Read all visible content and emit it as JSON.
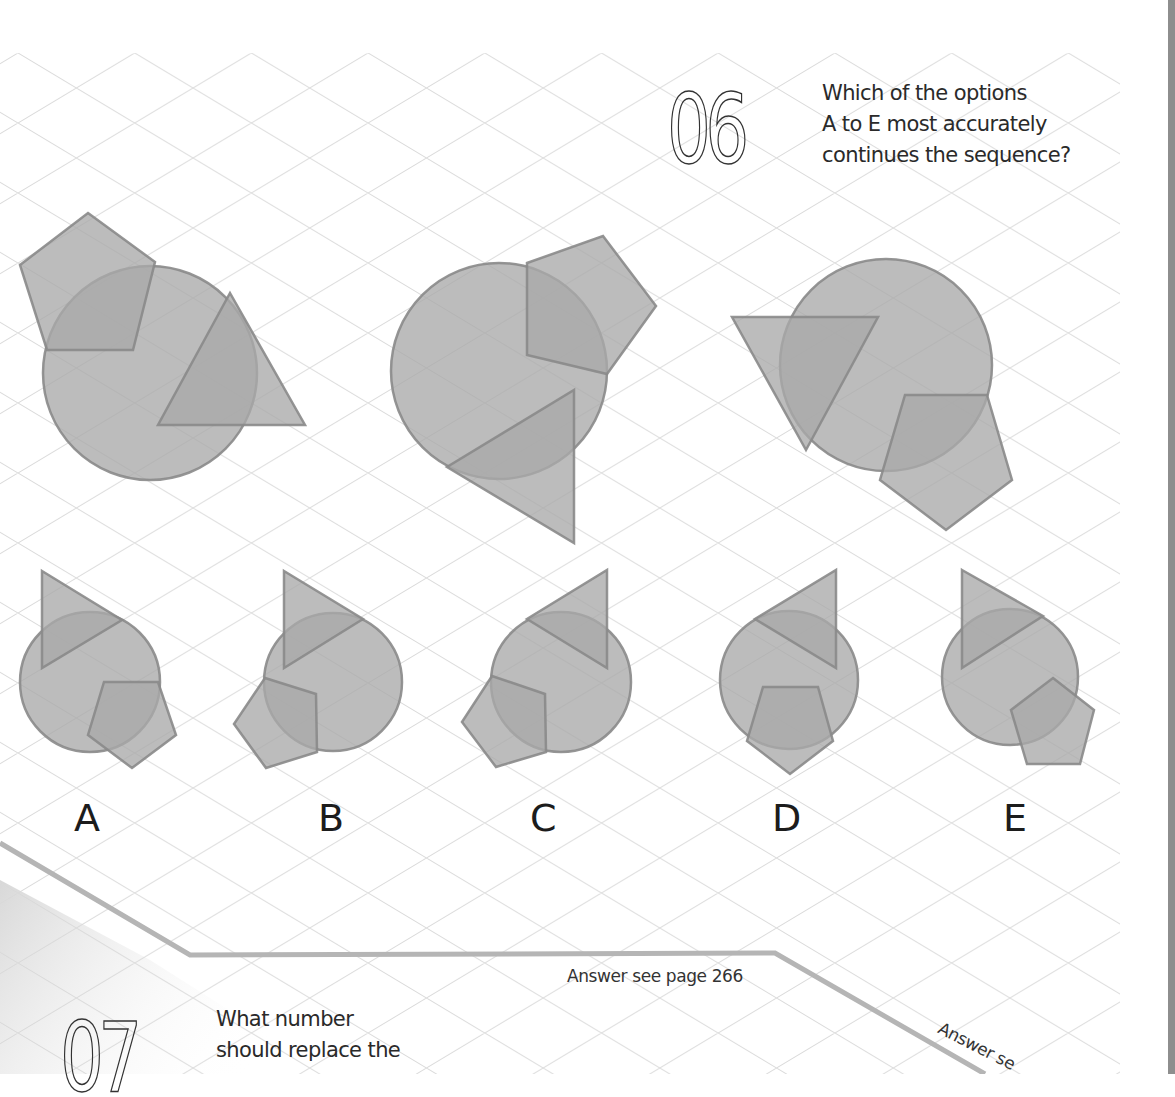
{
  "question_06": {
    "number": "06",
    "text_lines": [
      "Which of the options",
      "A to E most accurately",
      "continues the sequence?"
    ]
  },
  "sequence": [
    {
      "id": "figure-1",
      "circle": {
        "cx": 150,
        "cy": 373,
        "r": 107
      },
      "pentagon": "88,213 155,262 133,350 47,350 20,265",
      "triangle": "230,293 305,425 158,425"
    },
    {
      "id": "figure-2",
      "circle": {
        "cx": 499,
        "cy": 371,
        "r": 108
      },
      "pentagon": "527,263 603,236 656,306 607,374 527,355",
      "triangle": "574,390 574,543 447,467"
    },
    {
      "id": "figure-3",
      "circle": {
        "cx": 886,
        "cy": 365,
        "r": 106
      },
      "pentagon": "905,395 987,395 1012,480 946,530 880,480",
      "triangle": "732,317 878,317 806,450"
    }
  ],
  "options": [
    {
      "label": "A",
      "label_pos": {
        "x": 74,
        "y": 798
      },
      "circle": {
        "cx": 90,
        "cy": 682,
        "r": 70
      },
      "pentagon": "104,682 158,682 176,735 132,768 88,735",
      "triangle": "42,571 122,620 42,668"
    },
    {
      "label": "B",
      "label_pos": {
        "x": 318,
        "y": 798
      },
      "circle": {
        "cx": 333,
        "cy": 682,
        "r": 69
      },
      "pentagon": "265,678 316,694 317,752 266,768 234,724",
      "triangle": "284,571 363,619 284,668"
    },
    {
      "label": "C",
      "label_pos": {
        "x": 530,
        "y": 798
      },
      "circle": {
        "cx": 561,
        "cy": 682,
        "r": 70
      },
      "pentagon": "492,676 545,694 546,752 496,767 462,722",
      "triangle": "607,570 607,668 527,619"
    },
    {
      "label": "D",
      "label_pos": {
        "x": 772,
        "y": 798
      },
      "circle": {
        "cx": 789,
        "cy": 680,
        "r": 69
      },
      "pentagon": "763,687 818,687 833,741 790,774 747,741",
      "triangle": "836,570 836,668 755,619"
    },
    {
      "label": "E",
      "label_pos": {
        "x": 1003,
        "y": 798
      },
      "circle": {
        "cx": 1010,
        "cy": 677,
        "r": 68
      },
      "pentagon": "1053,678 1094,710 1080,764 1027,764 1011,710",
      "triangle": "962,570 1043,616 962,668"
    }
  ],
  "answer_note": "Answer see page 266",
  "answer_note_cut": "Answer se",
  "question_07": {
    "number": "07",
    "text_lines": [
      "What number",
      "should replace the"
    ]
  },
  "colors": {
    "shape_fill": "#a9a9a9",
    "shape_stroke": "#8a8a8a",
    "grid": "#dcdcdc",
    "divider": "#b5b5b5",
    "text": "#2a2a2a"
  }
}
